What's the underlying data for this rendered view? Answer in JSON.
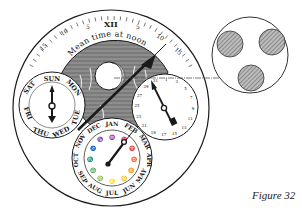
{
  "figure": {
    "caption": "Figure 32"
  },
  "main_dial": {
    "outer_ring_label": "Mean time at noon",
    "equation_scale": {
      "top_numeral": "XII",
      "tick_labels": [
        "15",
        "10",
        "5",
        "XII",
        "5",
        "10",
        "15"
      ]
    }
  },
  "day_subdial": {
    "labels": [
      "SUN",
      "MON",
      "TUE",
      "WED",
      "THU",
      "FRI",
      "SAT"
    ]
  },
  "month_subdial": {
    "labels": [
      "JAN",
      "FEB",
      "MAR",
      "APR",
      "MAY",
      "JUN",
      "JUL",
      "AUG",
      "SEP",
      "OCT",
      "NOV",
      "DEC"
    ]
  },
  "date_subdial": {
    "labels": [
      "31",
      "1",
      "3",
      "5",
      "7",
      "9",
      "11",
      "13",
      "15",
      "17",
      "19",
      "21",
      "23",
      "25",
      "27",
      "29"
    ]
  },
  "detail_inset": {
    "description": "Three hatched circles (moon aperture detail)",
    "circle_count": 3
  },
  "colors": {
    "ink": "#1a1a1a",
    "hatch": "#888888",
    "paper": "#ffffff"
  }
}
